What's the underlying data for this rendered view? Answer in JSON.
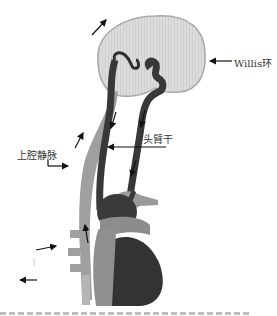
{
  "figure": {
    "labels": {
      "willis": "Willis环",
      "brachiocephalic": "头臂干",
      "svc": "上腔静脉"
    },
    "colors": {
      "brain": "#dedede",
      "brain_outline": "#a8a8a8",
      "artery": "#3a3a3a",
      "vein": "#9a9a9a",
      "arrow": "#111111",
      "label": "#333333"
    }
  }
}
